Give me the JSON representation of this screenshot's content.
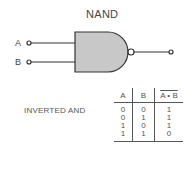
{
  "diagram": {
    "title": "NAND",
    "subtitle": "INVERTED AND",
    "inputs": [
      {
        "label": "A"
      },
      {
        "label": "B"
      }
    ],
    "colors": {
      "gate_fill": "#c8c8c8",
      "stroke": "#333333"
    }
  },
  "truth_table": {
    "headers": [
      "A",
      "B",
      "A • B"
    ],
    "rows": [
      [
        "0",
        "0",
        "1"
      ],
      [
        "0",
        "1",
        "1"
      ],
      [
        "1",
        "0",
        "1"
      ],
      [
        "1",
        "1",
        "0"
      ]
    ]
  }
}
